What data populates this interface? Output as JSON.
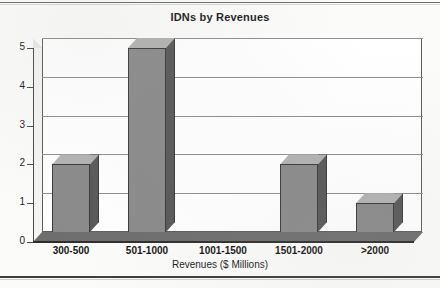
{
  "chart_data": {
    "type": "bar",
    "title": "IDNs by Revenues",
    "xlabel": "Revenues ($ Millions)",
    "ylabel": "",
    "categories": [
      "300-500",
      "501-1000",
      "1001-1500",
      "1501-2000",
      ">2000"
    ],
    "values": [
      2,
      5,
      0,
      2,
      1
    ],
    "ylim": [
      0,
      5
    ],
    "ytick_labels": [
      "0",
      "1",
      "2",
      "3",
      "4",
      "5"
    ],
    "grid": true,
    "legend": false,
    "style": "3d-column",
    "colors": {
      "bar_front": "#8a8a8a",
      "bar_side": "#585858",
      "bar_top": "#b2b2b2",
      "plot_background": "#ffffff",
      "page_background": "#fbfbfa",
      "axis": "#4a4a4a",
      "gridline": "#8e8e8e",
      "text": "#1c1c1c"
    }
  }
}
